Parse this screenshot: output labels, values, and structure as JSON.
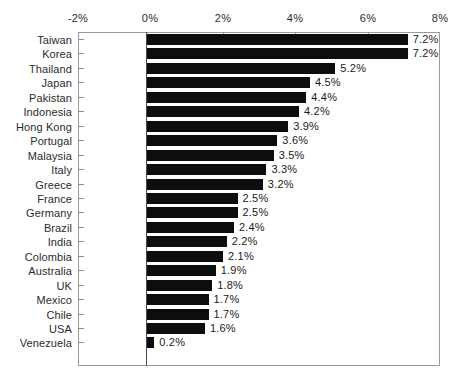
{
  "chart_data": {
    "type": "bar",
    "orientation": "horizontal",
    "title": "",
    "subtitle": "",
    "xlabel": "",
    "ylabel": "",
    "xlim": [
      -2,
      8
    ],
    "xticks": [
      -2,
      0,
      2,
      4,
      6,
      8
    ],
    "xtick_labels": [
      "-2%",
      "0%",
      "2%",
      "4%",
      "6%",
      "8%"
    ],
    "grid": false,
    "legend": null,
    "bar_color": "#0d0d0d",
    "frame_color": "#9a9a9a",
    "axis_color": "#4a4a4a",
    "text_color": "#2b2b2b",
    "value_suffix": "%",
    "categories": [
      "Taiwan",
      "Korea",
      "Thailand",
      "Japan",
      "Pakistan",
      "Indonesia",
      "Hong Kong",
      "Portugal",
      "Malaysia",
      "Italy",
      "Greece",
      "France",
      "Germany",
      "Brazil",
      "India",
      "Colombia",
      "Australia",
      "UK",
      "Mexico",
      "Chile",
      "USA",
      "Venezuela"
    ],
    "values": [
      7.2,
      7.2,
      5.2,
      4.5,
      4.4,
      4.2,
      3.9,
      3.6,
      3.5,
      3.3,
      3.2,
      2.5,
      2.5,
      2.4,
      2.2,
      2.1,
      1.9,
      1.8,
      1.7,
      1.7,
      1.6,
      0.2
    ],
    "value_labels": [
      "7.2%",
      "7.2%",
      "5.2%",
      "4.5%",
      "4.4%",
      "4.2%",
      "3.9%",
      "3.6%",
      "3.5%",
      "3.3%",
      "3.2%",
      "2.5%",
      "2.5%",
      "2.4%",
      "2.2%",
      "2.1%",
      "1.9%",
      "1.8%",
      "1.7%",
      "1.7%",
      "1.6%",
      "0.2%"
    ]
  }
}
